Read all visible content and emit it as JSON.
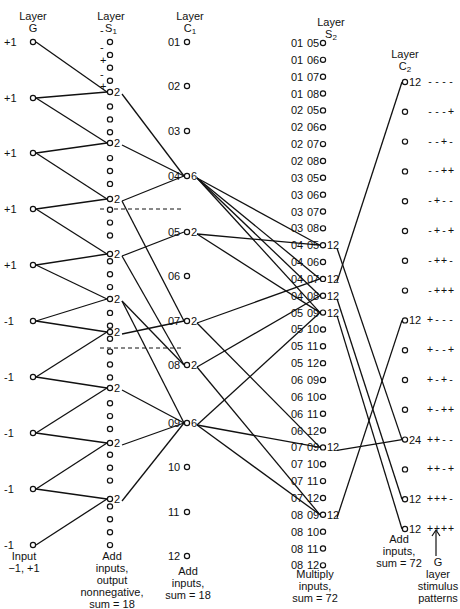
{
  "layers": {
    "G": {
      "title": "Layer",
      "name": "G"
    },
    "S1": {
      "title": "Layer",
      "name": "S",
      "sub": "1"
    },
    "C1": {
      "title": "Layer",
      "name": "C",
      "sub": "1"
    },
    "S2": {
      "title": "Layer",
      "name": "S",
      "sub": "2"
    },
    "C2": {
      "title": "Layer",
      "name": "C",
      "sub": "2"
    }
  },
  "g_nodes": [
    "+1",
    "+1",
    "+1",
    "+1",
    "+1",
    "-1",
    "-1",
    "-1",
    "-1",
    "-1"
  ],
  "s1_sign_markers": [
    "-",
    "-",
    "+",
    "-",
    "+"
  ],
  "s1_active_value": "2",
  "c1_nodes": [
    {
      "id": "01",
      "value": ""
    },
    {
      "id": "02",
      "value": ""
    },
    {
      "id": "03",
      "value": ""
    },
    {
      "id": "04",
      "value": "6"
    },
    {
      "id": "05",
      "value": "2"
    },
    {
      "id": "06",
      "value": ""
    },
    {
      "id": "07",
      "value": "2"
    },
    {
      "id": "08",
      "value": "2"
    },
    {
      "id": "09",
      "value": "6"
    },
    {
      "id": "10",
      "value": ""
    },
    {
      "id": "11",
      "value": ""
    },
    {
      "id": "12",
      "value": ""
    }
  ],
  "s2_nodes": [
    {
      "a": "01",
      "b": "05",
      "value": ""
    },
    {
      "a": "01",
      "b": "06",
      "value": ""
    },
    {
      "a": "01",
      "b": "07",
      "value": ""
    },
    {
      "a": "01",
      "b": "08",
      "value": ""
    },
    {
      "a": "02",
      "b": "05",
      "value": ""
    },
    {
      "a": "02",
      "b": "06",
      "value": ""
    },
    {
      "a": "02",
      "b": "07",
      "value": ""
    },
    {
      "a": "02",
      "b": "08",
      "value": ""
    },
    {
      "a": "03",
      "b": "05",
      "value": ""
    },
    {
      "a": "03",
      "b": "06",
      "value": ""
    },
    {
      "a": "03",
      "b": "07",
      "value": ""
    },
    {
      "a": "03",
      "b": "08",
      "value": ""
    },
    {
      "a": "04",
      "b": "05",
      "value": "12"
    },
    {
      "a": "04",
      "b": "06",
      "value": ""
    },
    {
      "a": "04",
      "b": "07",
      "value": "12"
    },
    {
      "a": "04",
      "b": "08",
      "value": "12"
    },
    {
      "a": "05",
      "b": "09",
      "value": "12"
    },
    {
      "a": "05",
      "b": "10",
      "value": ""
    },
    {
      "a": "05",
      "b": "11",
      "value": ""
    },
    {
      "a": "05",
      "b": "12",
      "value": ""
    },
    {
      "a": "06",
      "b": "09",
      "value": ""
    },
    {
      "a": "06",
      "b": "10",
      "value": ""
    },
    {
      "a": "06",
      "b": "11",
      "value": ""
    },
    {
      "a": "06",
      "b": "12",
      "value": ""
    },
    {
      "a": "07",
      "b": "09",
      "value": "12"
    },
    {
      "a": "07",
      "b": "10",
      "value": ""
    },
    {
      "a": "07",
      "b": "11",
      "value": ""
    },
    {
      "a": "07",
      "b": "12",
      "value": ""
    },
    {
      "a": "08",
      "b": "09",
      "value": "12"
    },
    {
      "a": "08",
      "b": "10",
      "value": ""
    },
    {
      "a": "08",
      "b": "11",
      "value": ""
    },
    {
      "a": "08",
      "b": "12",
      "value": ""
    }
  ],
  "c2_nodes": [
    {
      "value": "12",
      "pattern": "----"
    },
    {
      "value": "",
      "pattern": "---+"
    },
    {
      "value": "",
      "pattern": "--+-"
    },
    {
      "value": "",
      "pattern": "--++"
    },
    {
      "value": "",
      "pattern": "-+--"
    },
    {
      "value": "",
      "pattern": "-+-+"
    },
    {
      "value": "",
      "pattern": "-++-"
    },
    {
      "value": "",
      "pattern": "-+++"
    },
    {
      "value": "12",
      "pattern": "+---"
    },
    {
      "value": "",
      "pattern": "+--+"
    },
    {
      "value": "",
      "pattern": "+-+-"
    },
    {
      "value": "",
      "pattern": "+-++"
    },
    {
      "value": "24",
      "pattern": "++--"
    },
    {
      "value": "",
      "pattern": "++-+"
    },
    {
      "value": "12",
      "pattern": "+++-"
    },
    {
      "value": "12",
      "pattern": "++++"
    }
  ],
  "notes": {
    "g": "Input\n−1, +1",
    "s1": "Add\ninputs,\noutput\nnonnegative,\nsum = 18",
    "c1": "Add\ninputs,\nsum = 18",
    "s2": "Multiply\ninputs,\nsum = 72",
    "c2": "Add\ninputs,\nsum = 72",
    "patterns": "G\nlayer\nstimulus\npatterns"
  },
  "colors": {
    "line": "#111111",
    "background": "#ffffff"
  }
}
